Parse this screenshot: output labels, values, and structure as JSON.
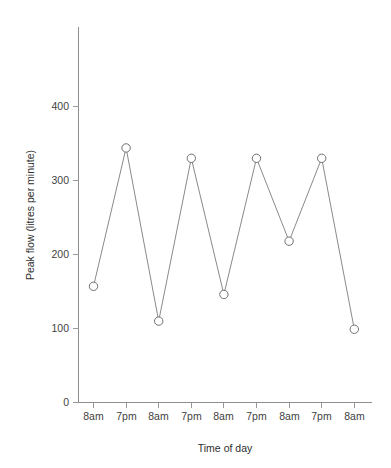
{
  "chart_data": {
    "type": "line",
    "title": "",
    "xlabel": "Time of day",
    "ylabel": "Peak flow (litres per minute)",
    "categories": [
      "8am",
      "7pm",
      "8am",
      "7pm",
      "8am",
      "7pm",
      "8am",
      "7pm",
      "8am"
    ],
    "values": [
      157,
      344,
      110,
      330,
      146,
      330,
      218,
      330,
      99
    ],
    "series": [
      {
        "name": "Peak flow",
        "values": [
          157,
          344,
          110,
          330,
          146,
          330,
          218,
          330,
          99
        ]
      }
    ],
    "ylim": [
      0,
      445
    ],
    "yticks": [
      0,
      100,
      200,
      300,
      400
    ],
    "ytick_labels": [
      "0",
      "100",
      "200",
      "300",
      "400"
    ],
    "xtick_labels": [
      "8am",
      "7pm",
      "8am",
      "7pm",
      "8am",
      "7pm",
      "8am",
      "7pm",
      "8am"
    ],
    "grid": false,
    "legend": null,
    "marker": "open-circle",
    "line_color": "#8a8a8a",
    "marker_fill": "#ffffff",
    "marker_stroke": "#6f6f6f",
    "axis_color": "#8d8d8d",
    "text_color": "#3a3a3a",
    "background": "#ffffff"
  },
  "axes": {
    "y_title": "Peak flow (litres per minute)",
    "x_title": "Time of day",
    "y_tick_0": "0",
    "y_tick_100": "100",
    "y_tick_200": "200",
    "y_tick_300": "300",
    "y_tick_400": "400",
    "x_tick_1": "8am",
    "x_tick_2": "7pm",
    "x_tick_3": "8am",
    "x_tick_4": "7pm",
    "x_tick_5": "8am",
    "x_tick_6": "7pm",
    "x_tick_7": "8am",
    "x_tick_8": "7pm",
    "x_tick_9": "8am"
  }
}
